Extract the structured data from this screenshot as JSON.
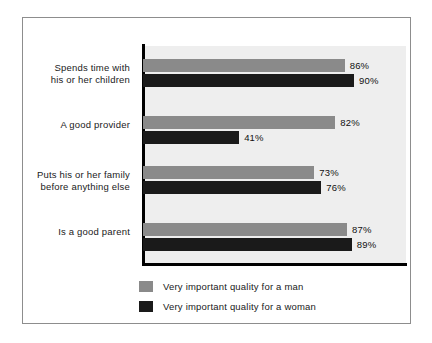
{
  "chart_data": {
    "type": "bar",
    "orientation": "horizontal",
    "title": "",
    "subtitle": "",
    "xlabel": "",
    "ylabel": "",
    "grid": false,
    "xlim": [
      0,
      100
    ],
    "legend_position": "bottom-left",
    "categories": [
      "Spends time with\nhis or her children",
      "A good provider",
      "Puts his or her family\nbefore anything else",
      "Is a good parent"
    ],
    "series": [
      {
        "name": "Very important quality for a man",
        "color": "#8a8a8a",
        "values": [
          86,
          82,
          73,
          87
        ],
        "value_labels": [
          "86%",
          "82%",
          "73%",
          "87%"
        ]
      },
      {
        "name": "Very important quality for a woman",
        "color": "#1a1a1a",
        "values": [
          90,
          41,
          76,
          89
        ],
        "value_labels": [
          "90%",
          "41%",
          "76%",
          "89%"
        ]
      }
    ]
  },
  "figure": {
    "background": "#ffffff",
    "plot_background": "#eeeeee",
    "border_color": "#8d8d8d",
    "axis_color": "#000000"
  },
  "legend": {
    "items": [
      {
        "label": "Very important quality for a man",
        "color": "#8a8a8a"
      },
      {
        "label": "Very important quality for a woman",
        "color": "#1a1a1a"
      }
    ]
  }
}
